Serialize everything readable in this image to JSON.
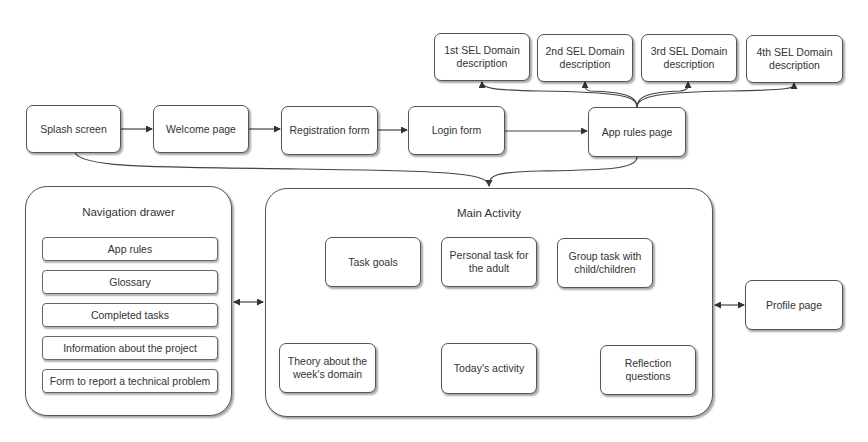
{
  "flow": {
    "splash": "Splash screen",
    "welcome": "Welcome page",
    "registration": "Registration form",
    "login": "Login form",
    "app_rules_page": "App rules page"
  },
  "sel_domains": [
    {
      "line1": "1st SEL Domain",
      "line2": "description"
    },
    {
      "line1": "2nd SEL Domain",
      "line2": "description"
    },
    {
      "line1": "3rd SEL Domain",
      "line2": "description"
    },
    {
      "line1": "4th SEL Domain",
      "line2": "description"
    }
  ],
  "navigation_drawer": {
    "title": "Navigation drawer",
    "items": [
      "App rules",
      "Glossary",
      "Completed tasks",
      "Information about the project",
      "Form to report a technical problem"
    ]
  },
  "main_activity": {
    "title": "Main Activity",
    "task_goals": "Task goals",
    "personal_task": {
      "line1": "Personal task for",
      "line2": "the adult"
    },
    "group_task": {
      "line1": "Group task with",
      "line2": "child/children"
    },
    "theory": {
      "line1": "Theory about the",
      "line2": "week's domain"
    },
    "todays_activity": "Today's activity",
    "reflection": {
      "line1": "Reflection",
      "line2": "questions"
    }
  },
  "profile_page": "Profile page",
  "colors": {
    "stroke": "#555555",
    "text": "#333333",
    "background": "#ffffff"
  }
}
